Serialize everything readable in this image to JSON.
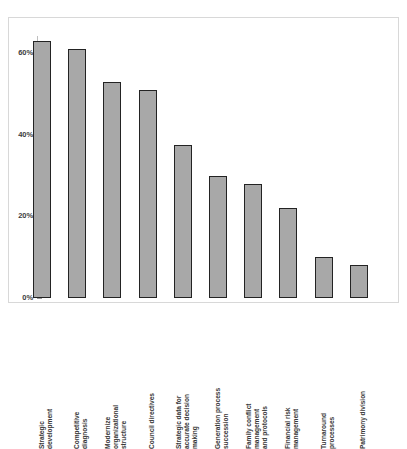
{
  "chart_data": {
    "type": "bar",
    "title": "",
    "subtitle": "",
    "xlabel": "",
    "ylabel": "",
    "ylim": [
      0,
      70
    ],
    "grid": false,
    "legend": "none",
    "orientation": "vertical",
    "y_tick_labels": [
      "0%",
      "20%",
      "40%",
      "60%"
    ],
    "y_tick_values": [
      0,
      20,
      40,
      60
    ],
    "categories": [
      "Strategic development",
      "Competitive diagnosis",
      "Modernize organizational structure",
      "Council directives",
      "Strategic data for accurate decision making",
      "Generation process succession",
      "Family conflict management and protocols",
      "Financial risk management",
      "Turnaround processes",
      "Patrimony division"
    ],
    "category_lines": [
      [
        "Strategic",
        "development"
      ],
      [
        "Competitive",
        "diagnosis"
      ],
      [
        "Modernize",
        "organizational",
        "structure"
      ],
      [
        "Council directives"
      ],
      [
        "Strategic data for",
        "accurate decision",
        "making"
      ],
      [
        "Generation process",
        "succession"
      ],
      [
        "Family  conflict",
        "management",
        "and protocols"
      ],
      [
        "Financial risk",
        "management"
      ],
      [
        "Turnaround",
        "processes"
      ],
      [
        "Patrimony division"
      ]
    ],
    "values": [
      63,
      61,
      53,
      51,
      37.5,
      30,
      28,
      22,
      10,
      8
    ],
    "value_labels": [
      "63%",
      "61%",
      "53%",
      "51%",
      "37.5%",
      "30%",
      "28%",
      "22%",
      "10%",
      "8%"
    ],
    "colors": {
      "bar_fill": "#a8a8a8",
      "bar_edge": "#232323",
      "axis": "#bfbfbf",
      "frame": "#d8d8d8",
      "text": "#3a3a3a",
      "background": "#ffffff"
    }
  }
}
